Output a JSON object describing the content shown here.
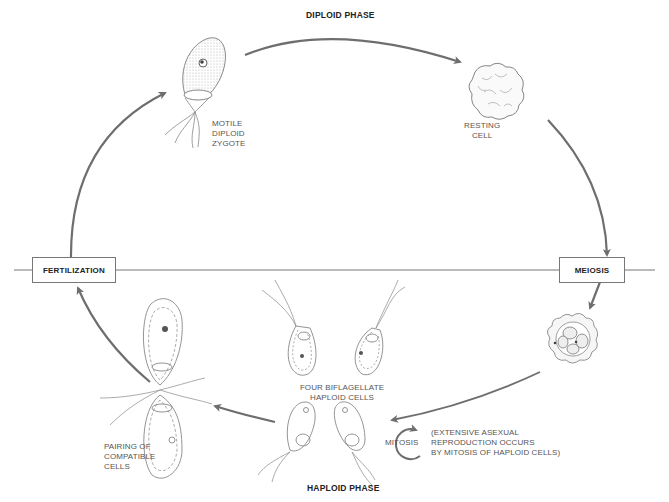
{
  "phases": {
    "top": "DIPLOID PHASE",
    "bottom": "HAPLOID PHASE"
  },
  "events": {
    "left": "FERTILIZATION",
    "right": "MEIOSIS"
  },
  "stages": {
    "zygote": [
      "MOTILE",
      "DIPLOID",
      "ZYGOTE"
    ],
    "resting": [
      "RESTING",
      "CELL"
    ],
    "haploid_cells": [
      "FOUR BIFLAGELLATE",
      "HAPLOID CELLS"
    ],
    "pairing": [
      "PAIRING OF",
      "COMPATIBLE",
      "CELLS"
    ]
  },
  "mitosis": {
    "label": "MITOSIS",
    "note": [
      "(EXTENSIVE ASEXUAL",
      "REPRODUCTION OCCURS",
      "BY MITOSIS OF HAPLOID CELLS)"
    ]
  },
  "colors": {
    "arrow": "#6e6e6e",
    "line": "#777777",
    "cell_stroke": "#888888",
    "stipple": "#c8c8c8"
  }
}
